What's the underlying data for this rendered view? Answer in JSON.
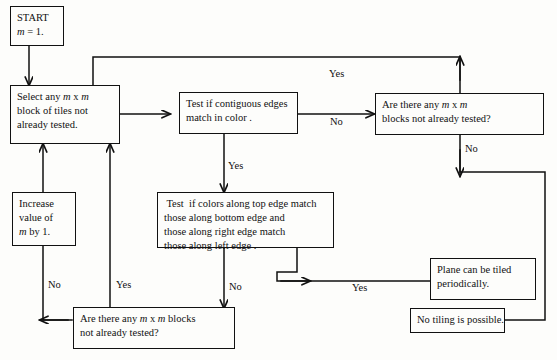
{
  "diagram": {
    "stroke_color": "#111111",
    "background_color": "#fdfdfb",
    "nodes": {
      "start": {
        "name": "start-node",
        "line1": "START",
        "line2_italic": "m",
        "line2_rest": " = 1."
      },
      "select_block": {
        "name": "select-block-node",
        "line1_a": "Select any ",
        "line1_m1": "m",
        "line1_b": " x ",
        "line1_m2": "m",
        "line2": "block of tiles not",
        "line3": "already tested."
      },
      "increase_m": {
        "name": "increase-m-node",
        "line1": "Increase",
        "line2": "value of",
        "line3_italic": "m",
        "line3_rest": " by 1."
      },
      "test_contiguous": {
        "name": "test-contiguous-edges-node",
        "line1": "Test if contiguous edges",
        "line2": "match in color ."
      },
      "test_colors": {
        "name": "test-colors-edges-node",
        "line1": " Test  if colors along top edge match",
        "line2": "those along bottom edge and",
        "line3": "those along right edge match",
        "line4": "those along left edge ."
      },
      "any_blocks_top": {
        "name": "any-blocks-top-node",
        "line1_a": "Are there any ",
        "line1_m1": "m",
        "line1_b": " x ",
        "line1_m2": "m",
        "line2": "blocks not already tested?"
      },
      "any_blocks_bottom": {
        "name": "any-blocks-bottom-node",
        "line1_a": "Are there any ",
        "line1_m1": "m",
        "line1_b": " x ",
        "line1_m2": "m",
        "line1_c": " blocks",
        "line2": "not already tested?"
      },
      "plane_tiled": {
        "name": "plane-tiled-node",
        "line1": "Plane can be tiled",
        "line2": "periodically."
      },
      "no_tiling": {
        "name": "no-tiling-node",
        "line1": "No tiling is possible."
      }
    },
    "edge_labels": {
      "yes_top_loop": "Yes",
      "no_contiguous": "No",
      "yes_contiguous": "Yes",
      "no_any_blocks_top": "No",
      "no_colors": "No",
      "yes_colors": "Yes",
      "no_increase": "No",
      "yes_bottom_loop": "Yes"
    }
  }
}
